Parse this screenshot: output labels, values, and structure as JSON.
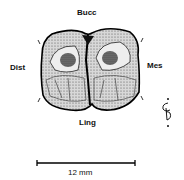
{
  "figure": {
    "labels": {
      "buccal": "Bucc",
      "distal": "Dist",
      "mesial": "Mes",
      "lingual": "Ling"
    },
    "scale_bar": {
      "label": "12 mm"
    },
    "orientation_icon": "orientation-glyph-icon"
  }
}
